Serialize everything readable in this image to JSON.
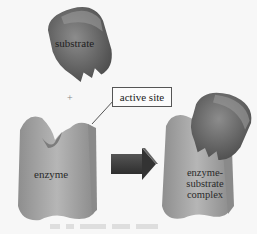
{
  "diagram": {
    "labels": {
      "substrate": "substrate",
      "plus": "+",
      "active_site": "active site",
      "enzyme": "enzyme",
      "complex_line1": "enzyme-",
      "complex_line2": "substrate",
      "complex_line3": "complex"
    },
    "colors": {
      "background": "#f7f7f7",
      "substrate": "#6e6e6e",
      "enzyme": "#a9a9a9",
      "arrow": "#3c3c3c"
    }
  }
}
